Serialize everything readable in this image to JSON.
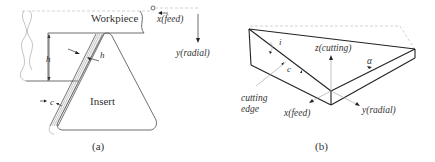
{
  "figure_a": {
    "caption": "(a)",
    "labels": {
      "workpiece": "Workpiece",
      "insert": "Insert",
      "x_axis": "x(feed)",
      "y_axis": "y(radial)",
      "h_vertical": "h",
      "h_chip": "h",
      "c": "c"
    }
  },
  "figure_b": {
    "caption": "(b)",
    "labels": {
      "z_axis": "z(cutting)",
      "x_axis": "x(feed)",
      "y_axis": "y(radial)",
      "cutting_edge_line1": "cutting",
      "cutting_edge_line2": "edge",
      "i": "i",
      "c": "c",
      "alpha": "α"
    }
  },
  "colors": {
    "line": "#4a4a4a",
    "text": "#333333",
    "background": "#ffffff"
  }
}
